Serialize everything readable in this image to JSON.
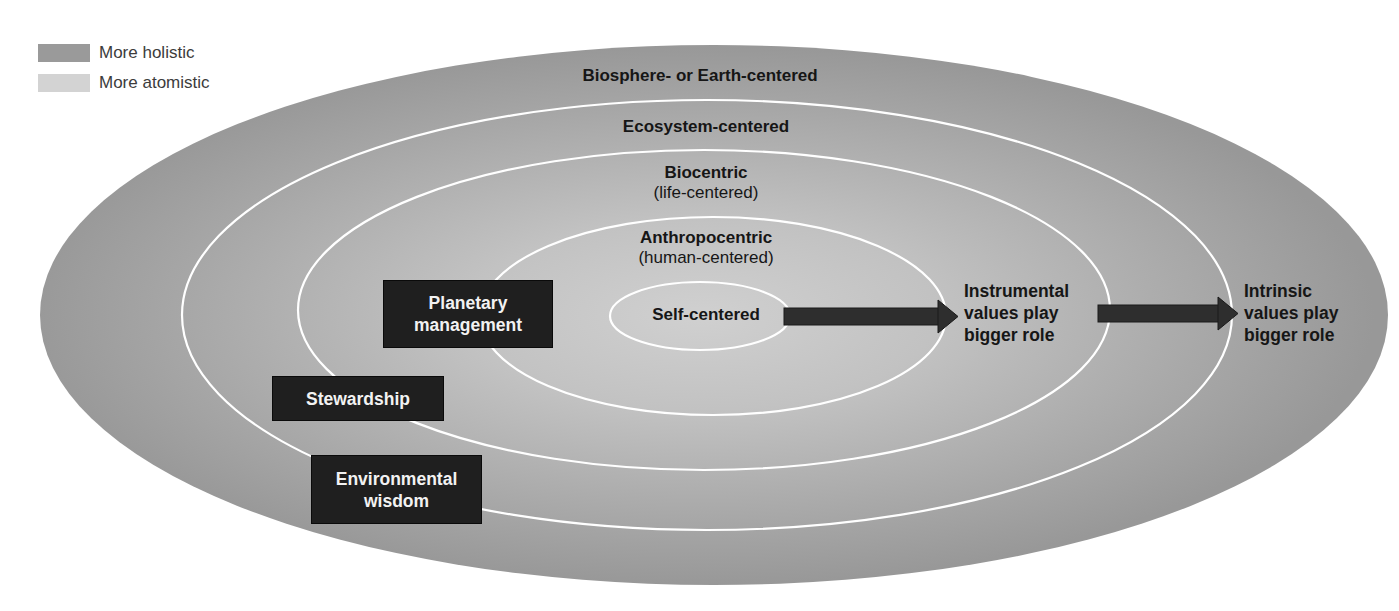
{
  "legend": {
    "items": [
      {
        "label": "More holistic",
        "color": "#9a9a9a"
      },
      {
        "label": "More atomistic",
        "color": "#d3d3d3"
      }
    ]
  },
  "colors": {
    "outer_fill": "#9c9c9c",
    "center_fill": "#cdcdcd",
    "ring_stroke": "#ffffff",
    "box_fill": "#1f1f1f",
    "arrow_fill": "#2e2e2e",
    "text": "#161616"
  },
  "rings": [
    {
      "name": "biosphere",
      "label": "Biosphere- or Earth-centered",
      "sublabel": ""
    },
    {
      "name": "ecosystem",
      "label": "Ecosystem-centered",
      "sublabel": ""
    },
    {
      "name": "biocentric",
      "label": "Biocentric",
      "sublabel": "(life-centered)"
    },
    {
      "name": "anthropocentric",
      "label": "Anthropocentric",
      "sublabel": "(human-centered)"
    },
    {
      "name": "self",
      "label": "Self-centered",
      "sublabel": ""
    }
  ],
  "boxes": [
    {
      "name": "planetary-management",
      "line1": "Planetary",
      "line2": "management"
    },
    {
      "name": "stewardship",
      "line1": "Stewardship",
      "line2": ""
    },
    {
      "name": "environmental-wisdom",
      "line1": "Environmental",
      "line2": "wisdom"
    }
  ],
  "side_labels": {
    "instrumental": {
      "line1": "Instrumental",
      "line2": "values play",
      "line3": "bigger role"
    },
    "intrinsic": {
      "line1": "Intrinsic",
      "line2": "values play",
      "line3": "bigger role"
    }
  }
}
